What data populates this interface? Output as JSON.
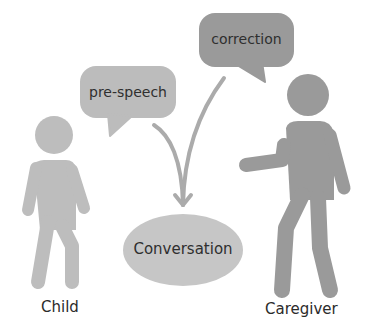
{
  "diagram": {
    "bubbles": {
      "pre_speech": {
        "label": "pre-speech",
        "color": "#bcbcbc"
      },
      "correction": {
        "label": "correction",
        "color": "#9a9a9a"
      }
    },
    "center": {
      "label": "Conversation",
      "color": "#c6c6c6"
    },
    "figures": {
      "child": {
        "label": "Child",
        "color": "#bdbdbd"
      },
      "caregiver": {
        "label": "Caregiver",
        "color": "#9a9a9a"
      }
    },
    "arrow_color": "#ababab",
    "text_color": "#2b2b2b"
  }
}
